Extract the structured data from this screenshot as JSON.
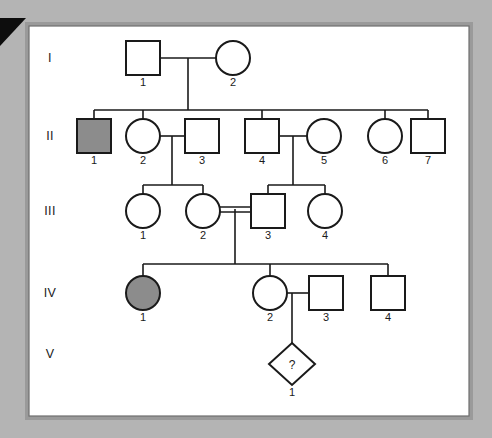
{
  "figure": {
    "background_color": "#b4b4b4",
    "panel_color": "#ffffff",
    "frame_color": "#9a9a9a",
    "line_color": "#1a1a1a",
    "affected_fill": "#8c8c8c",
    "unaffected_fill": "#ffffff",
    "pointer_marker": "black-right-triangle"
  },
  "generations": [
    {
      "label": "I",
      "y": 58
    },
    {
      "label": "II",
      "y": 136
    },
    {
      "label": "III",
      "y": 211
    },
    {
      "label": "IV",
      "y": 293
    },
    {
      "label": "V",
      "y": 354
    }
  ],
  "individuals": [
    {
      "id": "I-1",
      "generation": "I",
      "number": "1",
      "sex": "male",
      "shape": "square",
      "status": "unaffected",
      "cx": 143,
      "cy": 58
    },
    {
      "id": "I-2",
      "generation": "I",
      "number": "2",
      "sex": "female",
      "shape": "circle",
      "status": "unaffected",
      "cx": 233,
      "cy": 58
    },
    {
      "id": "II-1",
      "generation": "II",
      "number": "1",
      "sex": "male",
      "shape": "square",
      "status": "affected",
      "cx": 94,
      "cy": 136
    },
    {
      "id": "II-2",
      "generation": "II",
      "number": "2",
      "sex": "female",
      "shape": "circle",
      "status": "unaffected",
      "cx": 143,
      "cy": 136
    },
    {
      "id": "II-3",
      "generation": "II",
      "number": "3",
      "sex": "male",
      "shape": "square",
      "status": "unaffected",
      "cx": 202,
      "cy": 136
    },
    {
      "id": "II-4",
      "generation": "II",
      "number": "4",
      "sex": "male",
      "shape": "square",
      "status": "unaffected",
      "cx": 262,
      "cy": 136
    },
    {
      "id": "II-5",
      "generation": "II",
      "number": "5",
      "sex": "female",
      "shape": "circle",
      "status": "unaffected",
      "cx": 324,
      "cy": 136
    },
    {
      "id": "II-6",
      "generation": "II",
      "number": "6",
      "sex": "female",
      "shape": "circle",
      "status": "unaffected",
      "cx": 385,
      "cy": 136
    },
    {
      "id": "II-7",
      "generation": "II",
      "number": "7",
      "sex": "male",
      "shape": "square",
      "status": "unaffected",
      "cx": 428,
      "cy": 136
    },
    {
      "id": "III-1",
      "generation": "III",
      "number": "1",
      "sex": "female",
      "shape": "circle",
      "status": "unaffected",
      "cx": 143,
      "cy": 211
    },
    {
      "id": "III-2",
      "generation": "III",
      "number": "2",
      "sex": "female",
      "shape": "circle",
      "status": "unaffected",
      "cx": 203,
      "cy": 211
    },
    {
      "id": "III-3",
      "generation": "III",
      "number": "3",
      "sex": "male",
      "shape": "square",
      "status": "unaffected",
      "cx": 268,
      "cy": 211
    },
    {
      "id": "III-4",
      "generation": "III",
      "number": "4",
      "sex": "female",
      "shape": "circle",
      "status": "unaffected",
      "cx": 325,
      "cy": 211
    },
    {
      "id": "IV-1",
      "generation": "IV",
      "number": "1",
      "sex": "female",
      "shape": "circle",
      "status": "affected",
      "cx": 143,
      "cy": 293
    },
    {
      "id": "IV-2",
      "generation": "IV",
      "number": "2",
      "sex": "female",
      "shape": "circle",
      "status": "unaffected",
      "cx": 270,
      "cy": 293
    },
    {
      "id": "IV-3",
      "generation": "IV",
      "number": "3",
      "sex": "male",
      "shape": "square",
      "status": "unaffected",
      "cx": 326,
      "cy": 293
    },
    {
      "id": "IV-4",
      "generation": "IV",
      "number": "4",
      "sex": "male",
      "shape": "square",
      "status": "unaffected",
      "cx": 388,
      "cy": 293
    },
    {
      "id": "V-1",
      "generation": "V",
      "number": "1",
      "sex": "unknown",
      "shape": "diamond",
      "status": "unknown",
      "cx": 292,
      "cy": 363,
      "marker": "?"
    }
  ],
  "matings": [
    {
      "partners": [
        "I-1",
        "I-2"
      ],
      "consanguineous": false,
      "children": [
        "II-1",
        "II-2",
        "II-4",
        "II-6",
        "II-7"
      ]
    },
    {
      "partners": [
        "II-2",
        "II-3"
      ],
      "consanguineous": false,
      "children": [
        "III-1",
        "III-2"
      ]
    },
    {
      "partners": [
        "II-4",
        "II-5"
      ],
      "consanguineous": false,
      "children": [
        "III-3",
        "III-4"
      ]
    },
    {
      "partners": [
        "III-2",
        "III-3"
      ],
      "consanguineous": true,
      "children": [
        "IV-1",
        "IV-2",
        "IV-4"
      ]
    },
    {
      "partners": [
        "IV-2",
        "IV-3"
      ],
      "consanguineous": false,
      "children": [
        "V-1"
      ]
    }
  ],
  "legend_marks": {
    "unknown_sex_symbol": "?",
    "affected_note": "filled/shaded symbol"
  }
}
